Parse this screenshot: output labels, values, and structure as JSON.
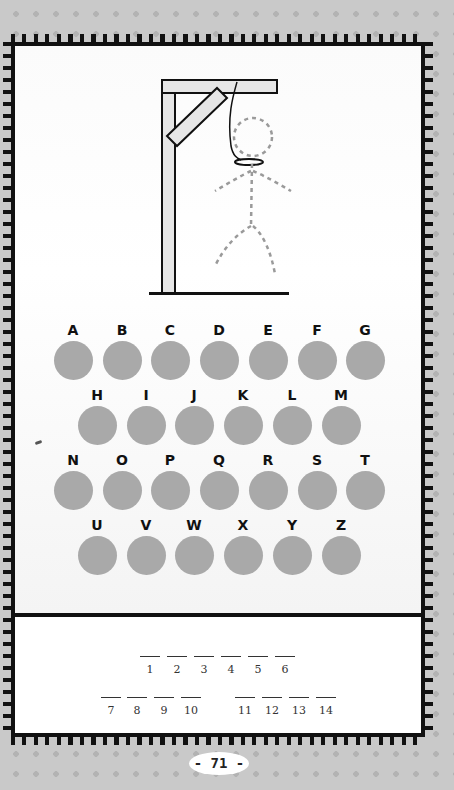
{
  "game": {
    "type": "hangman",
    "wrong_guesses_drawn": "full figure (dashed outline)"
  },
  "letters": {
    "rows": [
      [
        "A",
        "B",
        "C",
        "D",
        "E",
        "F",
        "G"
      ],
      [
        "H",
        "I",
        "J",
        "K",
        "L",
        "M"
      ],
      [
        "N",
        "O",
        "P",
        "Q",
        "R",
        "S",
        "T"
      ],
      [
        "U",
        "V",
        "W",
        "X",
        "Y",
        "Z"
      ]
    ]
  },
  "answer": {
    "word1": [
      "1",
      "2",
      "3",
      "4",
      "5",
      "6"
    ],
    "word2": [
      "7",
      "8",
      "9",
      "10"
    ],
    "word3": [
      "11",
      "12",
      "13",
      "14"
    ]
  },
  "page": {
    "number_label": "- 71 -"
  },
  "colors": {
    "bubble": "#a9a9a9",
    "border": "#111111",
    "background": "#c9c9c9",
    "figure_dash": "#9a9a9a",
    "gallows_fill": "#e6e6e6"
  }
}
